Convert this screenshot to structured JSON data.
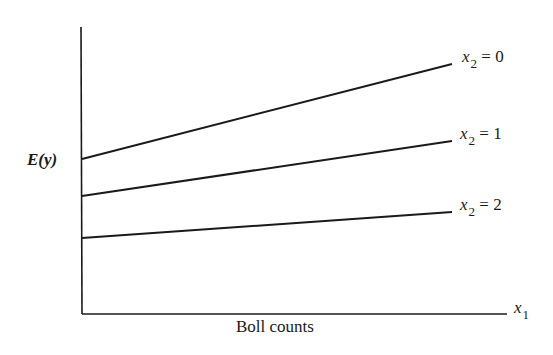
{
  "chart_data": {
    "type": "line",
    "title": "",
    "xlabel": "Boll counts",
    "ylabel": "E(y)",
    "x_axis_symbol": "x1",
    "grid": false,
    "legend_position": "inline-right",
    "x": [
      0,
      1
    ],
    "series": [
      {
        "name": "x2 = 0",
        "var": "x",
        "sub": "2",
        "eq": "= 0",
        "values": [
          0.54,
          0.87
        ],
        "px": [
          82,
          159,
          452,
          64
        ]
      },
      {
        "name": "x2 = 1",
        "var": "x",
        "sub": "2",
        "eq": "= 1",
        "values": [
          0.41,
          0.6
        ],
        "px": [
          82,
          196,
          452,
          141
        ]
      },
      {
        "name": "x2 = 2",
        "var": "x",
        "sub": "2",
        "eq": "= 2",
        "values": [
          0.27,
          0.36
        ],
        "px": [
          82,
          238,
          452,
          212
        ]
      }
    ]
  },
  "labels": {
    "ylabel": "E(y)",
    "xlabel": "Boll counts",
    "xvar": "x",
    "xsub": "1"
  }
}
